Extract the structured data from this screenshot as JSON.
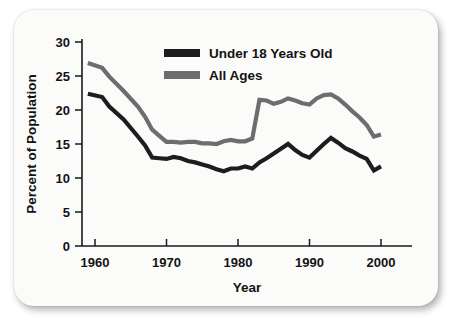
{
  "chart_data": {
    "type": "line",
    "title": "",
    "xlabel": "Year",
    "ylabel": "Percent of Population",
    "xlim": [
      1958,
      2001
    ],
    "ylim": [
      0,
      30
    ],
    "ytick_labels": [
      "0",
      "5",
      "10",
      "15",
      "20",
      "25",
      "30"
    ],
    "yticks": [
      0,
      5,
      10,
      15,
      20,
      25,
      30
    ],
    "xtick_labels": [
      "1960",
      "1970",
      "1980",
      "1990",
      "2000"
    ],
    "xticks": [
      1960,
      1970,
      1980,
      1990,
      2000
    ],
    "grid": false,
    "legend_position": "top-center",
    "series": [
      {
        "name": "Under 18 Years Old",
        "color": "#1d1d1d",
        "x": [
          1959,
          1961,
          1962,
          1964,
          1966,
          1967,
          1968,
          1969,
          1970,
          1971,
          1972,
          1973,
          1974,
          1975,
          1976,
          1977,
          1978,
          1979,
          1980,
          1981,
          1982,
          1983,
          1984,
          1985,
          1986,
          1987,
          1988,
          1989,
          1990,
          1991,
          1992,
          1993,
          1994,
          1995,
          1996,
          1997,
          1998,
          1999,
          2000
        ],
        "values": [
          22.4,
          21.9,
          20.5,
          18.6,
          16.1,
          14.8,
          13.0,
          12.9,
          12.8,
          13.1,
          12.9,
          12.5,
          12.3,
          12.0,
          11.7,
          11.3,
          11.0,
          11.4,
          11.4,
          11.7,
          11.4,
          12.3,
          12.9,
          13.6,
          14.3,
          15.0,
          14.1,
          13.4,
          13.0,
          14.0,
          15.0,
          15.9,
          15.2,
          14.4,
          13.9,
          13.3,
          12.8,
          11.1,
          11.7
        ]
      },
      {
        "name": "All Ages",
        "color": "#6d6d6d",
        "x": [
          1959,
          1961,
          1962,
          1964,
          1966,
          1967,
          1968,
          1969,
          1970,
          1971,
          1972,
          1973,
          1974,
          1975,
          1976,
          1977,
          1978,
          1979,
          1980,
          1981,
          1982,
          1983,
          1984,
          1985,
          1986,
          1987,
          1988,
          1989,
          1990,
          1991,
          1992,
          1993,
          1994,
          1995,
          1996,
          1997,
          1998,
          1999,
          2000
        ],
        "values": [
          26.9,
          26.2,
          24.9,
          22.8,
          20.5,
          19.0,
          17.1,
          16.2,
          15.3,
          15.3,
          15.2,
          15.3,
          15.3,
          15.1,
          15.1,
          15.0,
          15.4,
          15.6,
          15.4,
          15.4,
          15.8,
          21.5,
          21.4,
          20.9,
          21.2,
          21.7,
          21.4,
          21.0,
          20.8,
          21.7,
          22.2,
          22.3,
          21.7,
          20.8,
          19.8,
          18.9,
          17.8,
          16.1,
          16.4
        ]
      }
    ]
  },
  "legend": {
    "items": [
      {
        "label": "Under 18 Years Old",
        "color": "#1d1d1d"
      },
      {
        "label": "All Ages",
        "color": "#6d6d6d"
      }
    ]
  }
}
